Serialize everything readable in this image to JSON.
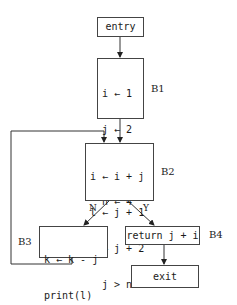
{
  "diagram": {
    "type": "control-flow-graph",
    "nodes": {
      "entry": {
        "label": "entry"
      },
      "B1": {
        "name": "B1",
        "lines": [
          "i ← 1",
          "j ← 2",
          "k ← 3",
          "n ← 4"
        ]
      },
      "B2": {
        "name": "B2",
        "lines": [
          "i ← i + j",
          "l ← j + 1",
          "j ← j + 2",
          "  j > n"
        ]
      },
      "B3": {
        "name": "B3",
        "lines": [
          "k ← k - j",
          "print(l)"
        ]
      },
      "B4": {
        "name": "B4",
        "label": "return j + i"
      },
      "exit": {
        "label": "exit"
      }
    },
    "edges": [
      {
        "from": "entry",
        "to": "B1",
        "label": ""
      },
      {
        "from": "B1",
        "to": "B2",
        "label": ""
      },
      {
        "from": "B2",
        "to": "B3",
        "label": "N"
      },
      {
        "from": "B2",
        "to": "B4",
        "label": "Y"
      },
      {
        "from": "B3",
        "to": "B2",
        "label": ""
      },
      {
        "from": "B4",
        "to": "exit",
        "label": ""
      }
    ],
    "edge_labels": {
      "no": "N",
      "yes": "Y"
    }
  }
}
